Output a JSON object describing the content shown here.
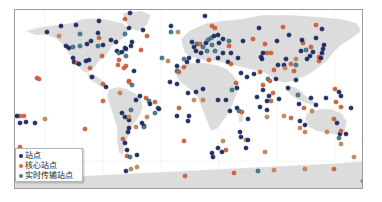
{
  "map": {
    "land_color": "#dcdcdc",
    "ocean_color": "#ffffff",
    "frame_color": "#9a9a9a"
  },
  "legend": {
    "items": [
      {
        "label": "站点",
        "color": "#1f2f6e"
      },
      {
        "label": "核心站点",
        "color": "#d9623b"
      },
      {
        "label": "实时传输站点",
        "color": "#3f8a83"
      }
    ]
  },
  "colors": {
    "station": "#1f2f6e",
    "core_station": "#d9623b",
    "core_station_light": "#c98a5a",
    "realtime_station": "#3f8a83"
  },
  "stations": [
    {
      "type": "station",
      "x": 46,
      "y": 31
    },
    {
      "type": "station",
      "x": 60,
      "y": 25
    },
    {
      "type": "station",
      "x": 75,
      "y": 24
    },
    {
      "type": "realtime_station",
      "x": 79,
      "y": 33
    },
    {
      "type": "station",
      "x": 98,
      "y": 20
    },
    {
      "type": "core_station_light",
      "x": 58,
      "y": 35
    },
    {
      "type": "station",
      "x": 65,
      "y": 45
    },
    {
      "type": "station",
      "x": 68,
      "y": 47
    },
    {
      "type": "realtime_station",
      "x": 72,
      "y": 46
    },
    {
      "type": "realtime_station",
      "x": 79,
      "y": 45
    },
    {
      "type": "station",
      "x": 86,
      "y": 43
    },
    {
      "type": "station",
      "x": 90,
      "y": 40
    },
    {
      "type": "station",
      "x": 97,
      "y": 32
    },
    {
      "type": "core_station",
      "x": 98,
      "y": 37
    },
    {
      "type": "realtime_station",
      "x": 97,
      "y": 45
    },
    {
      "type": "station",
      "x": 102,
      "y": 44
    },
    {
      "type": "station",
      "x": 110,
      "y": 39
    },
    {
      "type": "station",
      "x": 72,
      "y": 57
    },
    {
      "type": "station",
      "x": 73,
      "y": 61
    },
    {
      "type": "core_station",
      "x": 76,
      "y": 62
    },
    {
      "type": "station",
      "x": 78,
      "y": 63
    },
    {
      "type": "station",
      "x": 85,
      "y": 60
    },
    {
      "type": "station",
      "x": 88,
      "y": 59
    },
    {
      "type": "core_station",
      "x": 89,
      "y": 67
    },
    {
      "type": "core_station",
      "x": 101,
      "y": 55
    },
    {
      "type": "station",
      "x": 91,
      "y": 76
    },
    {
      "type": "station",
      "x": 115,
      "y": 41
    },
    {
      "type": "station",
      "x": 116,
      "y": 50
    },
    {
      "type": "realtime_station",
      "x": 118,
      "y": 52
    },
    {
      "type": "station",
      "x": 121,
      "y": 51
    },
    {
      "type": "station",
      "x": 125,
      "y": 48
    },
    {
      "type": "realtime_station",
      "x": 125,
      "y": 55
    },
    {
      "type": "station",
      "x": 124,
      "y": 47
    },
    {
      "type": "core_station",
      "x": 118,
      "y": 59
    },
    {
      "type": "station",
      "x": 130,
      "y": 45
    },
    {
      "type": "core_station",
      "x": 117,
      "y": 64
    },
    {
      "type": "core_station",
      "x": 123,
      "y": 67
    },
    {
      "type": "core_station",
      "x": 102,
      "y": 83
    },
    {
      "type": "station",
      "x": 105,
      "y": 86
    },
    {
      "type": "core_station_light",
      "x": 119,
      "y": 92
    },
    {
      "type": "core_station",
      "x": 128,
      "y": 80
    },
    {
      "type": "core_station",
      "x": 36,
      "y": 77
    },
    {
      "type": "core_station",
      "x": 38,
      "y": 78
    },
    {
      "type": "station",
      "x": 129,
      "y": 12
    },
    {
      "type": "core_station",
      "x": 124,
      "y": 18
    },
    {
      "type": "station",
      "x": 128,
      "y": 27
    },
    {
      "type": "core_station",
      "x": 146,
      "y": 35
    },
    {
      "type": "realtime_station",
      "x": 124,
      "y": 33
    },
    {
      "type": "station",
      "x": 131,
      "y": 41
    },
    {
      "type": "station",
      "x": 142,
      "y": 29
    },
    {
      "type": "core_station",
      "x": 140,
      "y": 49
    },
    {
      "type": "core_station",
      "x": 125,
      "y": 65
    },
    {
      "type": "station",
      "x": 133,
      "y": 70
    },
    {
      "type": "core_station",
      "x": 128,
      "y": 81
    },
    {
      "type": "realtime_station",
      "x": 131,
      "y": 84
    },
    {
      "type": "station",
      "x": 139,
      "y": 95
    },
    {
      "type": "station",
      "x": 170,
      "y": 25
    },
    {
      "type": "realtime_station",
      "x": 170,
      "y": 31
    },
    {
      "type": "core_station_light",
      "x": 177,
      "y": 31
    },
    {
      "type": "station",
      "x": 204,
      "y": 15
    },
    {
      "type": "core_station",
      "x": 211,
      "y": 25
    },
    {
      "type": "core_station",
      "x": 214,
      "y": 27
    },
    {
      "type": "station",
      "x": 191,
      "y": 41
    },
    {
      "type": "station",
      "x": 193,
      "y": 46
    },
    {
      "type": "realtime_station",
      "x": 196,
      "y": 43
    },
    {
      "type": "core_station",
      "x": 199,
      "y": 43
    },
    {
      "type": "realtime_station",
      "x": 202,
      "y": 46
    },
    {
      "type": "station",
      "x": 205,
      "y": 42
    },
    {
      "type": "realtime_station",
      "x": 207,
      "y": 39
    },
    {
      "type": "realtime_station",
      "x": 210,
      "y": 37
    },
    {
      "type": "station",
      "x": 213,
      "y": 35
    },
    {
      "type": "station",
      "x": 217,
      "y": 34
    },
    {
      "type": "realtime_station",
      "x": 211,
      "y": 44
    },
    {
      "type": "realtime_station",
      "x": 206,
      "y": 50
    },
    {
      "type": "station",
      "x": 200,
      "y": 52
    },
    {
      "type": "station",
      "x": 195,
      "y": 50
    },
    {
      "type": "realtime_station",
      "x": 214,
      "y": 50
    },
    {
      "type": "station",
      "x": 218,
      "y": 42
    },
    {
      "type": "station",
      "x": 222,
      "y": 38
    },
    {
      "type": "realtime_station",
      "x": 228,
      "y": 40
    },
    {
      "type": "core_station",
      "x": 228,
      "y": 45
    },
    {
      "type": "station",
      "x": 230,
      "y": 52
    },
    {
      "type": "station",
      "x": 222,
      "y": 52
    },
    {
      "type": "station",
      "x": 217,
      "y": 57
    },
    {
      "type": "core_station",
      "x": 208,
      "y": 59
    },
    {
      "type": "station",
      "x": 188,
      "y": 57
    },
    {
      "type": "station",
      "x": 186,
      "y": 61
    },
    {
      "type": "core_station",
      "x": 183,
      "y": 66
    },
    {
      "type": "realtime_station",
      "x": 183,
      "y": 58
    },
    {
      "type": "station",
      "x": 197,
      "y": 60
    },
    {
      "type": "station",
      "x": 227,
      "y": 61
    },
    {
      "type": "core_station",
      "x": 230,
      "y": 63
    },
    {
      "type": "station",
      "x": 237,
      "y": 57
    },
    {
      "type": "station",
      "x": 242,
      "y": 40
    },
    {
      "type": "core_station",
      "x": 252,
      "y": 38
    },
    {
      "type": "realtime_station",
      "x": 161,
      "y": 57
    },
    {
      "type": "core_station_light",
      "x": 167,
      "y": 60
    },
    {
      "type": "station",
      "x": 176,
      "y": 65
    },
    {
      "type": "realtime_station",
      "x": 176,
      "y": 70
    },
    {
      "type": "core_station",
      "x": 178,
      "y": 71
    },
    {
      "type": "station",
      "x": 169,
      "y": 81
    },
    {
      "type": "station",
      "x": 176,
      "y": 83
    },
    {
      "type": "station",
      "x": 187,
      "y": 92
    },
    {
      "type": "station",
      "x": 195,
      "y": 91
    },
    {
      "type": "core_station_light",
      "x": 193,
      "y": 99
    },
    {
      "type": "station",
      "x": 202,
      "y": 88
    },
    {
      "type": "core_station_light",
      "x": 202,
      "y": 99
    },
    {
      "type": "station",
      "x": 217,
      "y": 99
    },
    {
      "type": "station",
      "x": 225,
      "y": 99
    },
    {
      "type": "realtime_station",
      "x": 231,
      "y": 89
    },
    {
      "type": "station",
      "x": 236,
      "y": 87
    },
    {
      "type": "core_station",
      "x": 235,
      "y": 82
    },
    {
      "type": "station",
      "x": 246,
      "y": 76
    },
    {
      "type": "station",
      "x": 240,
      "y": 72
    },
    {
      "type": "station",
      "x": 236,
      "y": 107
    },
    {
      "type": "realtime_station",
      "x": 238,
      "y": 110
    },
    {
      "type": "core_station",
      "x": 241,
      "y": 111
    },
    {
      "type": "station",
      "x": 229,
      "y": 110
    },
    {
      "type": "station",
      "x": 247,
      "y": 118
    },
    {
      "type": "core_station",
      "x": 178,
      "y": 107
    },
    {
      "type": "station",
      "x": 188,
      "y": 115
    },
    {
      "type": "station",
      "x": 176,
      "y": 115
    },
    {
      "type": "station",
      "x": 239,
      "y": 131
    },
    {
      "type": "station",
      "x": 240,
      "y": 136
    },
    {
      "type": "core_station_light",
      "x": 245,
      "y": 139
    },
    {
      "type": "station",
      "x": 247,
      "y": 139
    },
    {
      "type": "core_station_light",
      "x": 222,
      "y": 140
    },
    {
      "type": "station",
      "x": 217,
      "y": 147
    },
    {
      "type": "station",
      "x": 221,
      "y": 151
    },
    {
      "type": "core_station",
      "x": 225,
      "y": 149
    },
    {
      "type": "station",
      "x": 211,
      "y": 152
    },
    {
      "type": "station",
      "x": 212,
      "y": 156
    },
    {
      "type": "core_station",
      "x": 183,
      "y": 140
    },
    {
      "type": "station",
      "x": 187,
      "y": 120
    },
    {
      "type": "station",
      "x": 258,
      "y": 27
    },
    {
      "type": "core_station",
      "x": 282,
      "y": 26
    },
    {
      "type": "station",
      "x": 321,
      "y": 28
    },
    {
      "type": "core_station",
      "x": 315,
      "y": 24
    },
    {
      "type": "station",
      "x": 288,
      "y": 34
    },
    {
      "type": "station",
      "x": 315,
      "y": 37
    },
    {
      "type": "core_station",
      "x": 302,
      "y": 42
    },
    {
      "type": "station",
      "x": 301,
      "y": 39
    },
    {
      "type": "station",
      "x": 276,
      "y": 40
    },
    {
      "type": "core_station",
      "x": 264,
      "y": 43
    },
    {
      "type": "core_station",
      "x": 270,
      "y": 52
    },
    {
      "type": "core_station",
      "x": 266,
      "y": 52
    },
    {
      "type": "station",
      "x": 262,
      "y": 52
    },
    {
      "type": "station",
      "x": 260,
      "y": 56
    },
    {
      "type": "station",
      "x": 261,
      "y": 58
    },
    {
      "type": "station",
      "x": 300,
      "y": 50
    },
    {
      "type": "realtime_station",
      "x": 305,
      "y": 49
    },
    {
      "type": "core_station",
      "x": 310,
      "y": 46
    },
    {
      "type": "station",
      "x": 312,
      "y": 51
    },
    {
      "type": "station",
      "x": 309,
      "y": 55
    },
    {
      "type": "station",
      "x": 306,
      "y": 58
    },
    {
      "type": "core_station",
      "x": 318,
      "y": 56
    },
    {
      "type": "core_station",
      "x": 318,
      "y": 60
    },
    {
      "type": "station",
      "x": 320,
      "y": 57
    },
    {
      "type": "station",
      "x": 321,
      "y": 52
    },
    {
      "type": "station",
      "x": 322,
      "y": 48
    },
    {
      "type": "station",
      "x": 323,
      "y": 44
    },
    {
      "type": "station",
      "x": 277,
      "y": 64
    },
    {
      "type": "station",
      "x": 283,
      "y": 64
    },
    {
      "type": "core_station",
      "x": 290,
      "y": 63
    },
    {
      "type": "realtime_station",
      "x": 295,
      "y": 64
    },
    {
      "type": "core_station",
      "x": 293,
      "y": 70
    },
    {
      "type": "core_station",
      "x": 273,
      "y": 69
    },
    {
      "type": "core_station",
      "x": 259,
      "y": 71
    },
    {
      "type": "core_station_light",
      "x": 284,
      "y": 67
    },
    {
      "type": "station",
      "x": 285,
      "y": 58
    },
    {
      "type": "core_station_light",
      "x": 295,
      "y": 58
    },
    {
      "type": "station",
      "x": 275,
      "y": 78
    },
    {
      "type": "realtime_station",
      "x": 267,
      "y": 78
    },
    {
      "type": "core_station",
      "x": 269,
      "y": 80
    },
    {
      "type": "core_station",
      "x": 262,
      "y": 84
    },
    {
      "type": "station",
      "x": 262,
      "y": 89
    },
    {
      "type": "station",
      "x": 287,
      "y": 87
    },
    {
      "type": "station",
      "x": 295,
      "y": 79
    },
    {
      "type": "station",
      "x": 253,
      "y": 73
    },
    {
      "type": "core_station",
      "x": 272,
      "y": 92
    },
    {
      "type": "station",
      "x": 256,
      "y": 96
    },
    {
      "type": "station",
      "x": 268,
      "y": 95
    },
    {
      "type": "station",
      "x": 278,
      "y": 98
    },
    {
      "type": "realtime_station",
      "x": 297,
      "y": 94
    },
    {
      "type": "station",
      "x": 310,
      "y": 97
    },
    {
      "type": "station",
      "x": 325,
      "y": 97
    },
    {
      "type": "core_station",
      "x": 334,
      "y": 88
    },
    {
      "type": "station",
      "x": 338,
      "y": 91
    },
    {
      "type": "station",
      "x": 340,
      "y": 95
    },
    {
      "type": "station",
      "x": 298,
      "y": 103
    },
    {
      "type": "core_station",
      "x": 303,
      "y": 107
    },
    {
      "type": "station",
      "x": 315,
      "y": 104
    },
    {
      "type": "core_station",
      "x": 335,
      "y": 101
    },
    {
      "type": "station",
      "x": 350,
      "y": 107
    },
    {
      "type": "station",
      "x": 259,
      "y": 106
    },
    {
      "type": "station",
      "x": 266,
      "y": 109
    },
    {
      "type": "core_station_light",
      "x": 266,
      "y": 116
    },
    {
      "type": "core_station_light",
      "x": 283,
      "y": 115
    },
    {
      "type": "core_station",
      "x": 290,
      "y": 117
    },
    {
      "type": "core_station_light",
      "x": 311,
      "y": 110
    },
    {
      "type": "core_station",
      "x": 340,
      "y": 106
    },
    {
      "type": "station",
      "x": 299,
      "y": 120
    },
    {
      "type": "station",
      "x": 304,
      "y": 124
    },
    {
      "type": "core_station_light",
      "x": 299,
      "y": 127
    },
    {
      "type": "core_station_light",
      "x": 304,
      "y": 131
    },
    {
      "type": "station",
      "x": 339,
      "y": 133
    },
    {
      "type": "core_station",
      "x": 340,
      "y": 130
    },
    {
      "type": "station",
      "x": 345,
      "y": 133
    },
    {
      "type": "core_station_light",
      "x": 326,
      "y": 131
    },
    {
      "type": "realtime_station",
      "x": 338,
      "y": 137
    },
    {
      "type": "core_station_light",
      "x": 340,
      "y": 143
    },
    {
      "type": "station",
      "x": 336,
      "y": 122
    },
    {
      "type": "core_station",
      "x": 333,
      "y": 118
    },
    {
      "type": "core_station_light",
      "x": 368,
      "y": 137
    },
    {
      "type": "core_station_light",
      "x": 368,
      "y": 142
    },
    {
      "type": "core_station_light",
      "x": 366,
      "y": 147
    },
    {
      "type": "core_station_light",
      "x": 353,
      "y": 156
    },
    {
      "type": "station",
      "x": 245,
      "y": 147
    },
    {
      "type": "core_station_light",
      "x": 264,
      "y": 151
    },
    {
      "type": "core_station",
      "x": 19,
      "y": 115
    },
    {
      "type": "core_station",
      "x": 23,
      "y": 115
    },
    {
      "type": "station",
      "x": 16,
      "y": 115
    },
    {
      "type": "station",
      "x": 19,
      "y": 122
    },
    {
      "type": "station",
      "x": 25,
      "y": 121
    },
    {
      "type": "station",
      "x": 34,
      "y": 122
    },
    {
      "type": "core_station_light",
      "x": 44,
      "y": 118
    },
    {
      "type": "core_station",
      "x": 84,
      "y": 128
    },
    {
      "type": "core_station",
      "x": 102,
      "y": 100
    },
    {
      "type": "core_station",
      "x": 19,
      "y": 146
    },
    {
      "type": "station",
      "x": 135,
      "y": 99
    },
    {
      "type": "core_station",
      "x": 145,
      "y": 97
    },
    {
      "type": "realtime_station",
      "x": 148,
      "y": 100
    },
    {
      "type": "station",
      "x": 149,
      "y": 103
    },
    {
      "type": "station",
      "x": 121,
      "y": 112
    },
    {
      "type": "station",
      "x": 124,
      "y": 116
    },
    {
      "type": "station",
      "x": 128,
      "y": 119
    },
    {
      "type": "core_station_light",
      "x": 128,
      "y": 116
    },
    {
      "type": "core_station_light",
      "x": 135,
      "y": 126
    },
    {
      "type": "realtime_station",
      "x": 130,
      "y": 109
    },
    {
      "type": "core_station_light",
      "x": 146,
      "y": 116
    },
    {
      "type": "station",
      "x": 141,
      "y": 122
    },
    {
      "type": "station",
      "x": 143,
      "y": 125
    },
    {
      "type": "realtime_station",
      "x": 143,
      "y": 126
    },
    {
      "type": "station",
      "x": 128,
      "y": 127
    },
    {
      "type": "station",
      "x": 127,
      "y": 131
    },
    {
      "type": "core_station",
      "x": 122,
      "y": 138
    },
    {
      "type": "station",
      "x": 124,
      "y": 142
    },
    {
      "type": "station",
      "x": 126,
      "y": 149
    },
    {
      "type": "core_station",
      "x": 126,
      "y": 155
    },
    {
      "type": "realtime_station",
      "x": 129,
      "y": 156
    },
    {
      "type": "station",
      "x": 136,
      "y": 154
    },
    {
      "type": "core_station",
      "x": 154,
      "y": 101
    },
    {
      "type": "realtime_station",
      "x": 157,
      "y": 107
    },
    {
      "type": "realtime_station",
      "x": 154,
      "y": 112
    },
    {
      "type": "station",
      "x": 158,
      "y": 108
    },
    {
      "type": "station",
      "x": 125,
      "y": 170
    },
    {
      "type": "core_station_light",
      "x": 130,
      "y": 168
    },
    {
      "type": "core_station_light",
      "x": 136,
      "y": 166
    },
    {
      "type": "core_station",
      "x": 184,
      "y": 175
    },
    {
      "type": "core_station",
      "x": 233,
      "y": 172
    },
    {
      "type": "core_station_light",
      "x": 273,
      "y": 169
    },
    {
      "type": "realtime_station",
      "x": 257,
      "y": 170
    },
    {
      "type": "core_station_light",
      "x": 304,
      "y": 168
    },
    {
      "type": "core_station",
      "x": 333,
      "y": 168
    },
    {
      "type": "core_station",
      "x": 362,
      "y": 180
    },
    {
      "type": "core_station",
      "x": 270,
      "y": 100
    },
    {
      "type": "station",
      "x": 266,
      "y": 100
    }
  ]
}
